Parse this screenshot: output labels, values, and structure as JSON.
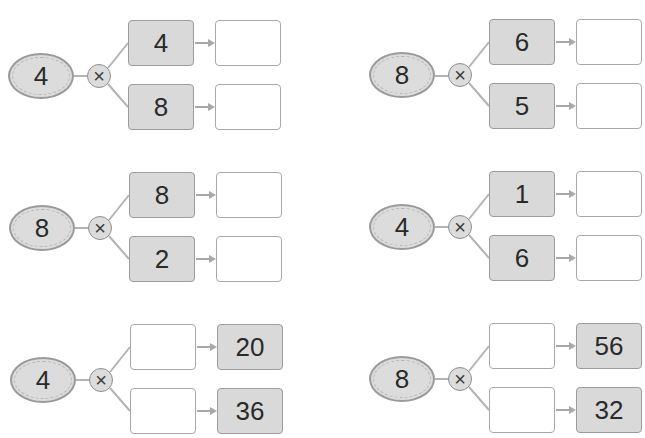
{
  "header": {
    "cutoff_text": ""
  },
  "colors": {
    "filled_box": "#d9d9d9",
    "box_border": "#9c9c9c",
    "oval_fill": "#dcdcdc",
    "oval_border": "#9a9a9a",
    "connector": "#b3b3b3",
    "arrow": "#a8a8a8"
  },
  "operator_symbol": "×",
  "problems": [
    {
      "multiplier": "4",
      "top": {
        "input": "4",
        "result": ""
      },
      "bottom": {
        "input": "8",
        "result": ""
      }
    },
    {
      "multiplier": "8",
      "top": {
        "input": "6",
        "result": ""
      },
      "bottom": {
        "input": "5",
        "result": ""
      }
    },
    {
      "multiplier": "8",
      "top": {
        "input": "8",
        "result": ""
      },
      "bottom": {
        "input": "2",
        "result": ""
      }
    },
    {
      "multiplier": "4",
      "top": {
        "input": "1",
        "result": ""
      },
      "bottom": {
        "input": "6",
        "result": ""
      }
    },
    {
      "multiplier": "4",
      "top": {
        "input": "",
        "result": "20"
      },
      "bottom": {
        "input": "",
        "result": "36"
      }
    },
    {
      "multiplier": "8",
      "top": {
        "input": "",
        "result": "56"
      },
      "bottom": {
        "input": "",
        "result": "32"
      }
    }
  ]
}
